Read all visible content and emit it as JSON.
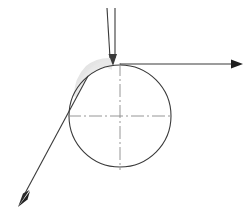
{
  "canvas": {
    "width": 250,
    "height": 217,
    "background": "#ffffff",
    "title": "Circle with tangent and directional arrows"
  },
  "colors": {
    "stroke": "#3a3a3a",
    "stroke_light": "#6b6b6b",
    "centerline": "#8a8a8a",
    "shade": "#e2e2e2",
    "background": "#ffffff"
  },
  "chart_data": {
    "type": "diagram",
    "xlabel": "",
    "ylabel": "",
    "xlim": [
      0,
      250
    ],
    "ylim": [
      0,
      217
    ],
    "grid": false,
    "legend": "none",
    "shapes": [
      {
        "name": "main-circle",
        "type": "circle",
        "cx": 120,
        "cy": 116,
        "r": 51,
        "fill": "none",
        "stroke": "#3a3a3a",
        "stroke_width": 1.1
      },
      {
        "name": "shaded-wedge",
        "type": "path",
        "fill": "#e2e2e2",
        "stroke": "none",
        "description": "light gray crescent shading at upper-left of circle near contact point"
      },
      {
        "name": "vertical-centerline",
        "type": "line",
        "x1": 120,
        "y1": 63,
        "x2": 120,
        "y2": 170,
        "stroke": "#8a8a8a",
        "style": "dash-dot"
      },
      {
        "name": "horizontal-centerline",
        "type": "line",
        "x1": 68,
        "y1": 116,
        "x2": 173,
        "y2": 116,
        "stroke": "#8a8a8a",
        "style": "dash-dot"
      },
      {
        "name": "down-arrow-shaft-left",
        "type": "line",
        "x1": 107,
        "y1": 8,
        "x2": 110,
        "y2": 58,
        "stroke": "#3a3a3a"
      },
      {
        "name": "down-arrow-shaft-right",
        "type": "line",
        "x1": 115,
        "y1": 8,
        "x2": 115,
        "y2": 58,
        "stroke": "#3a3a3a"
      },
      {
        "name": "down-arrow-head",
        "type": "arrowhead",
        "tip_x": 113,
        "tip_y": 66,
        "direction": "down",
        "fill": "#3a3a3a"
      },
      {
        "name": "right-arrow-shaft",
        "type": "line",
        "x1": 120,
        "y1": 64,
        "x2": 233,
        "y2": 64,
        "stroke": "#3a3a3a"
      },
      {
        "name": "right-arrow-head",
        "type": "arrowhead",
        "tip_x": 243,
        "tip_y": 64,
        "direction": "right",
        "fill": "#1f1f1f"
      },
      {
        "name": "tangent-line",
        "type": "line",
        "x1": 88,
        "y1": 76,
        "x2": 23,
        "y2": 197,
        "stroke": "#3a3a3a"
      },
      {
        "name": "tangent-arrow-head",
        "type": "arrowhead",
        "tip_x": 18,
        "tip_y": 207,
        "direction": "down-left",
        "fill": "#1f1f1f"
      }
    ],
    "annotations": []
  }
}
